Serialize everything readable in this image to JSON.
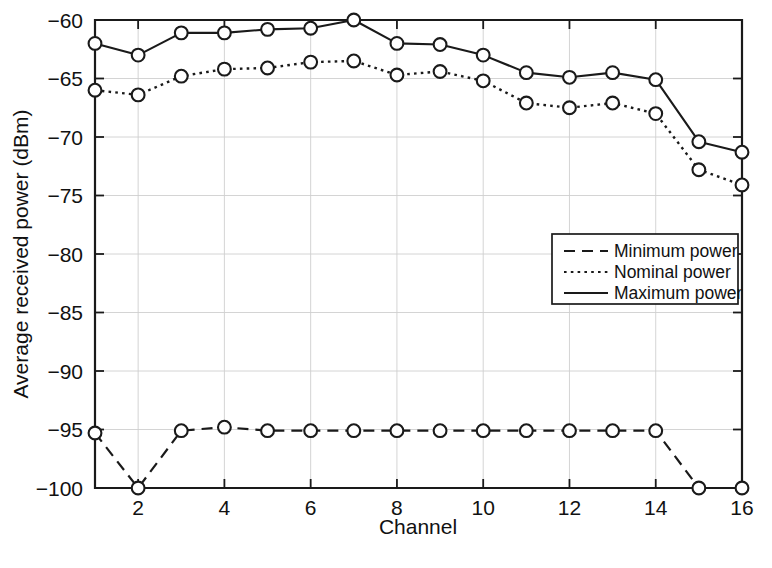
{
  "chart_data": {
    "type": "line",
    "title": "",
    "xlabel": "Channel",
    "ylabel": "Average received power (dBm)",
    "xlim": [
      1,
      16
    ],
    "ylim": [
      -100,
      -60
    ],
    "xticks": [
      2,
      4,
      6,
      8,
      10,
      12,
      14,
      16
    ],
    "xticklabels": [
      "2",
      "4",
      "6",
      "8",
      "10",
      "12",
      "14",
      "16"
    ],
    "yticks": [
      -60,
      -65,
      -70,
      -75,
      -80,
      -85,
      -90,
      -95,
      -100
    ],
    "yticklabels": [
      "−60",
      "−65",
      "−70",
      "−75",
      "−80",
      "−85",
      "−90",
      "−95",
      "−100"
    ],
    "grid": true,
    "grid_color": "#cfcfcf",
    "line_color": "#1a1a1a",
    "marker": "circle-open",
    "legend_position": "center-right",
    "x": [
      1,
      2,
      3,
      4,
      5,
      6,
      7,
      8,
      9,
      10,
      11,
      12,
      13,
      14,
      15,
      16
    ],
    "series": [
      {
        "name": "Minimum power",
        "style": "dashed",
        "values": [
          -95.3,
          -100.0,
          -95.1,
          -94.8,
          -95.1,
          -95.1,
          -95.1,
          -95.1,
          -95.1,
          -95.1,
          -95.1,
          -95.1,
          -95.1,
          -95.1,
          -100.0,
          -100.0
        ]
      },
      {
        "name": "Nominal power",
        "style": "dotted",
        "values": [
          -66.0,
          -66.4,
          -64.8,
          -64.2,
          -64.1,
          -63.6,
          -63.5,
          -64.7,
          -64.4,
          -65.2,
          -67.1,
          -67.5,
          -67.1,
          -68.0,
          -72.8,
          -74.1
        ]
      },
      {
        "name": "Maximum power",
        "style": "solid",
        "values": [
          -62.0,
          -63.0,
          -61.1,
          -61.1,
          -60.8,
          -60.7,
          -60.0,
          -62.0,
          -62.1,
          -63.0,
          -64.5,
          -64.9,
          -64.5,
          -65.1,
          -70.4,
          -71.3
        ]
      }
    ]
  },
  "legend": {
    "items": [
      {
        "label": "Minimum power",
        "style": "dashed"
      },
      {
        "label": "Nominal power",
        "style": "dotted"
      },
      {
        "label": "Maximum power",
        "style": "solid"
      }
    ]
  },
  "caption": {
    "partial_text": ""
  }
}
